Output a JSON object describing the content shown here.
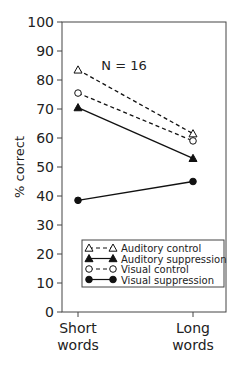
{
  "chart_data": {
    "type": "line",
    "title": "",
    "annotation": "N = 16",
    "xlabel": "",
    "ylabel": "% correct",
    "ylim": [
      0,
      100
    ],
    "yticks": [
      0,
      10,
      20,
      30,
      40,
      50,
      60,
      70,
      80,
      90,
      100
    ],
    "categories": [
      "Short words",
      "Long words"
    ],
    "category_lines": [
      [
        "Short",
        "words"
      ],
      [
        "Long",
        "words"
      ]
    ],
    "legend_position": "lower center inside",
    "grid": false,
    "series": [
      {
        "name": "Auditory control",
        "values": [
          83.5,
          61.5
        ],
        "line": "dashed",
        "marker": "open-triangle"
      },
      {
        "name": "Auditory suppression",
        "values": [
          70.5,
          53
        ],
        "line": "solid",
        "marker": "filled-triangle"
      },
      {
        "name": "Visual control",
        "values": [
          75.5,
          59
        ],
        "line": "dashed",
        "marker": "open-circle"
      },
      {
        "name": "Visual suppression",
        "values": [
          38.5,
          45
        ],
        "line": "solid",
        "marker": "filled-circle"
      }
    ]
  }
}
